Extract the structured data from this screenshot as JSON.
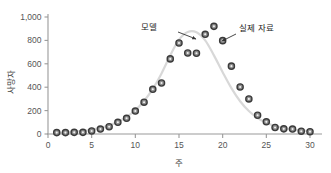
{
  "chart_data": {
    "type": "scatter",
    "title": "",
    "xlabel": "주",
    "ylabel": "사망자",
    "xlim": [
      0,
      31
    ],
    "ylim": [
      0,
      1000
    ],
    "xticks": [
      0,
      5,
      10,
      15,
      20,
      25,
      30
    ],
    "xticklabels": [
      "0",
      "5",
      "10",
      "15",
      "20",
      "25",
      "30"
    ],
    "yticks": [
      0,
      200,
      400,
      600,
      800,
      1000
    ],
    "yticklabels": [
      "0",
      "200",
      "400",
      "600",
      "800",
      "1,000"
    ],
    "grid": false,
    "legend": "none",
    "series": [
      {
        "name": "실제 자료",
        "kind": "scatter",
        "marker": "circle",
        "marker_face": "#8a8a8a",
        "marker_edge": "#3a3a3a",
        "x": [
          1,
          2,
          3,
          4,
          5,
          6,
          7,
          8,
          9,
          10,
          11,
          12,
          13,
          14,
          15,
          16,
          17,
          18,
          19,
          20,
          21,
          22,
          23,
          24,
          25,
          26,
          27,
          28,
          29,
          30
        ],
        "y": [
          12,
          12,
          14,
          14,
          26,
          42,
          62,
          100,
          134,
          196,
          272,
          382,
          436,
          642,
          778,
          692,
          690,
          852,
          920,
          798,
          580,
          402,
          300,
          160,
          104,
          56,
          44,
          42,
          24,
          20
        ]
      },
      {
        "name": "모델",
        "kind": "line",
        "color": "#d8d8d8",
        "x": [
          1,
          2,
          3,
          4,
          5,
          6,
          7,
          8,
          9,
          10,
          11,
          12,
          13,
          14,
          15,
          16,
          17,
          18,
          19,
          20,
          21,
          22,
          23,
          24,
          25,
          26,
          27,
          28,
          29,
          30
        ],
        "y": [
          10,
          13,
          18,
          26,
          37,
          52,
          74,
          104,
          146,
          203,
          282,
          386,
          518,
          672,
          806,
          872,
          870,
          800,
          672,
          528,
          392,
          280,
          196,
          136,
          96,
          68,
          50,
          38,
          30,
          24
        ]
      }
    ],
    "annotations": [
      {
        "name": "모델",
        "label": "모델",
        "label_x": 157,
        "label_y": 30,
        "arrow_from_x": 178,
        "arrow_from_y": 32,
        "arrow_to_x": 196,
        "arrow_to_y": 39
      },
      {
        "name": "실제 자료",
        "label": "실제 자료",
        "label_x": 239,
        "label_y": 31,
        "arrow_from_x": 236,
        "arrow_from_y": 34,
        "arrow_to_x": 222,
        "arrow_to_y": 41
      }
    ],
    "colors": {
      "axis": "#9a9a9a",
      "marker_face": "#8a8a8a",
      "marker_edge": "#3a3a3a",
      "model_line": "#d8d8d8",
      "text": "#444444",
      "background": "#ffffff"
    }
  }
}
